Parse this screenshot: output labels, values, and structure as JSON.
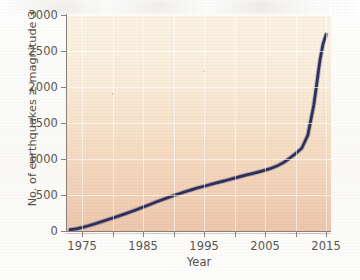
{
  "chart_data": {
    "type": "line",
    "title": "",
    "xlabel": "Year",
    "ylabel": "No. of earthquakes ≥ magnitude 3",
    "xlim": [
      1972.5,
      2015.8
    ],
    "ylim": [
      0,
      3000
    ],
    "xticks": [
      1975,
      1980,
      1985,
      1990,
      1995,
      2000,
      2005,
      2010,
      2015
    ],
    "xticklabels": [
      "1975",
      "",
      "1985",
      "",
      "1995",
      "",
      "2005",
      "",
      "2015"
    ],
    "yticks": [
      0,
      500,
      1000,
      1500,
      2000,
      2500,
      3000
    ],
    "yticklabels": [
      "0",
      "500",
      "1000",
      "1500",
      "2000",
      "2500",
      "3000"
    ],
    "grid": true,
    "legend": null,
    "series": [
      {
        "name": "Cumulative earthquakes ≥ magnitude 3",
        "color": "#2b2f5e",
        "x": [
          1973.0,
          1974.0,
          1975.0,
          1976.0,
          1977.0,
          1978.0,
          1979.0,
          1980.0,
          1981.0,
          1982.0,
          1983.0,
          1984.0,
          1985.0,
          1986.0,
          1987.0,
          1988.0,
          1989.0,
          1990.0,
          1991.0,
          1992.0,
          1993.0,
          1994.0,
          1995.0,
          1996.0,
          1997.0,
          1998.0,
          1999.0,
          2000.0,
          2001.0,
          2002.0,
          2003.0,
          2004.0,
          2005.0,
          2006.0,
          2007.0,
          2008.0,
          2009.0,
          2010.0,
          2011.0,
          2012.0,
          2013.0,
          2014.0,
          2014.5,
          2015.0
        ],
        "y": [
          18,
          30,
          48,
          72,
          98,
          125,
          152,
          180,
          208,
          238,
          268,
          300,
          333,
          366,
          400,
          432,
          462,
          492,
          520,
          548,
          575,
          600,
          622,
          645,
          668,
          690,
          712,
          735,
          758,
          780,
          800,
          822,
          845,
          872,
          905,
          950,
          1010,
          1075,
          1150,
          1330,
          1760,
          2380,
          2600,
          2730
        ]
      }
    ]
  },
  "axis": {
    "y_title": "No. of earthquakes ≥ magnitude 3",
    "x_title": "Year"
  }
}
